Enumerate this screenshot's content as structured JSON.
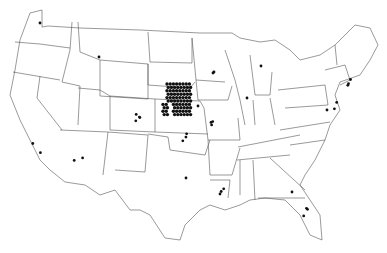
{
  "map": {
    "title": "",
    "region": "Contiguous United States",
    "colors": {
      "border": "#555555",
      "marker": "#111111",
      "background": "#ffffff"
    },
    "markers": [
      {
        "state": "WA",
        "count": 1
      },
      {
        "state": "MT",
        "count": 1
      },
      {
        "state": "CO",
        "count": 4
      },
      {
        "state": "NE",
        "count": 80
      },
      {
        "state": "KS",
        "count": 3
      },
      {
        "state": "MN",
        "count": 1
      },
      {
        "state": "IA",
        "count": 1
      },
      {
        "state": "MO",
        "count": 3
      },
      {
        "state": "IL",
        "count": 1
      },
      {
        "state": "WI",
        "count": 1
      },
      {
        "state": "MI",
        "count": 1
      },
      {
        "state": "OK",
        "count": 1
      },
      {
        "state": "CA",
        "count": 2
      },
      {
        "state": "AZ",
        "count": 2
      },
      {
        "state": "TX",
        "count": 2
      },
      {
        "state": "LA",
        "count": 1
      },
      {
        "state": "GA",
        "count": 1
      },
      {
        "state": "FL",
        "count": 3
      },
      {
        "state": "MA",
        "count": 3
      },
      {
        "state": "NJ",
        "count": 2
      },
      {
        "state": "MD",
        "count": 1
      }
    ]
  }
}
